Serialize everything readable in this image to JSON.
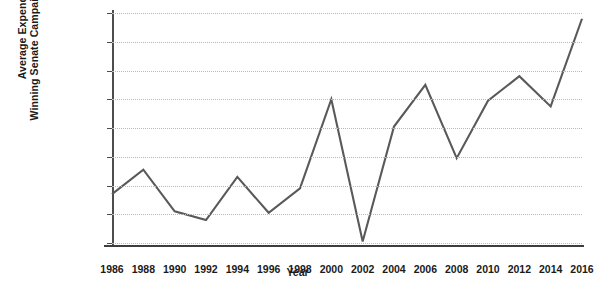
{
  "chart_data": {
    "type": "line",
    "title": "",
    "xlabel": "Year",
    "ylabel": "Average Expenditures on Winning Senate Campaigns(2014 Dollars)",
    "ylabel_line1": "Average Expenditures on",
    "ylabel_line2": "Winning Senate Campaigns(2014 Dollars)",
    "categories": [
      1986,
      1988,
      1990,
      1992,
      1994,
      1996,
      1998,
      2000,
      2002,
      2004,
      2006,
      2008,
      2010,
      2012,
      2014,
      2016
    ],
    "xtick_labels": [
      "1986",
      "1988",
      "1990",
      "1992",
      "1994",
      "1996",
      "1998",
      "2000",
      "2002",
      "2004",
      "2006",
      "2008",
      "2010",
      "2012",
      "2014",
      "2016"
    ],
    "values": [
      6700000,
      7550000,
      6100000,
      5800000,
      7300000,
      6050000,
      6900000,
      10000000,
      5050000,
      9050000,
      10500000,
      7950000,
      9950000,
      10800000,
      9750000,
      12800000
    ],
    "ytick_values": [
      5000000,
      6000000,
      7000000,
      8000000,
      9000000,
      10000000,
      11000000,
      12000000,
      13000000
    ],
    "ytick_labels": [
      "$5,000,000",
      "$6,000,000",
      "$7,000,000",
      "$8,000,000",
      "$9,000,000",
      "$10,000,000",
      "$11,000,000",
      "$12,000,000",
      "$13,000,000"
    ],
    "ylim": [
      5000000,
      13000000
    ],
    "xlim": [
      1986,
      2016
    ],
    "grid": true,
    "legend": "none",
    "series_color": "#595959",
    "grid_color": "#b9b9b9",
    "axis_color": "#4d4d4d"
  }
}
